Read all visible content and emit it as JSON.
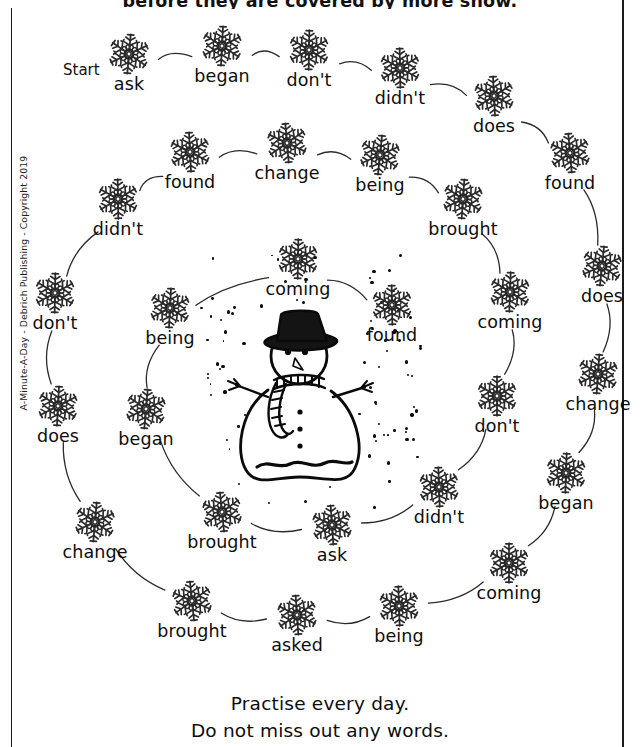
{
  "worksheet": {
    "top_instruction": "before they are covered by more snow.",
    "start_label": "Start",
    "copyright": "A-Minute-A-Day - Debrich Publishing - Copyright 2019",
    "footer_line1": "Practise every day.",
    "footer_line2": "Do not miss out any words.",
    "ink_color": "#0d0d0d",
    "paper_color": "#ffffff"
  },
  "center_illustration": {
    "name": "snowman",
    "features": [
      "top-hat",
      "carrot-nose",
      "coal-eyes",
      "striped-scarf",
      "twig-arms",
      "coal-buttons",
      "snow-ground"
    ]
  },
  "nodes": [
    {
      "id": 0,
      "word": "ask",
      "x": 129,
      "y": 54,
      "ring": "outer"
    },
    {
      "id": 1,
      "word": "began",
      "x": 222,
      "y": 46,
      "ring": "outer"
    },
    {
      "id": 2,
      "word": "don't",
      "x": 309,
      "y": 50,
      "ring": "outer"
    },
    {
      "id": 3,
      "word": "didn't",
      "x": 400,
      "y": 68,
      "ring": "outer"
    },
    {
      "id": 4,
      "word": "does",
      "x": 494,
      "y": 96,
      "ring": "outer"
    },
    {
      "id": 5,
      "word": "found",
      "x": 570,
      "y": 153,
      "ring": "outer"
    },
    {
      "id": 6,
      "word": "does",
      "x": 602,
      "y": 266,
      "ring": "outer"
    },
    {
      "id": 7,
      "word": "change",
      "x": 598,
      "y": 374,
      "ring": "outer"
    },
    {
      "id": 8,
      "word": "began",
      "x": 566,
      "y": 473,
      "ring": "outer"
    },
    {
      "id": 9,
      "word": "coming",
      "x": 509,
      "y": 563,
      "ring": "outer"
    },
    {
      "id": 10,
      "word": "being",
      "x": 399,
      "y": 606,
      "ring": "outer"
    },
    {
      "id": 11,
      "word": "asked",
      "x": 297,
      "y": 615,
      "ring": "outer"
    },
    {
      "id": 12,
      "word": "brought",
      "x": 192,
      "y": 601,
      "ring": "outer"
    },
    {
      "id": 13,
      "word": "change",
      "x": 95,
      "y": 522,
      "ring": "outer"
    },
    {
      "id": 14,
      "word": "does",
      "x": 58,
      "y": 406,
      "ring": "outer"
    },
    {
      "id": 15,
      "word": "don't",
      "x": 55,
      "y": 293,
      "ring": "outer"
    },
    {
      "id": 16,
      "word": "didn't",
      "x": 118,
      "y": 199,
      "ring": "outer"
    },
    {
      "id": 17,
      "word": "found",
      "x": 190,
      "y": 152,
      "ring": "middle"
    },
    {
      "id": 18,
      "word": "change",
      "x": 287,
      "y": 143,
      "ring": "middle"
    },
    {
      "id": 19,
      "word": "being",
      "x": 380,
      "y": 155,
      "ring": "middle"
    },
    {
      "id": 20,
      "word": "brought",
      "x": 463,
      "y": 199,
      "ring": "middle"
    },
    {
      "id": 21,
      "word": "coming",
      "x": 510,
      "y": 292,
      "ring": "middle"
    },
    {
      "id": 22,
      "word": "don't",
      "x": 497,
      "y": 396,
      "ring": "middle"
    },
    {
      "id": 23,
      "word": "didn't",
      "x": 439,
      "y": 487,
      "ring": "middle"
    },
    {
      "id": 24,
      "word": "ask",
      "x": 332,
      "y": 525,
      "ring": "middle"
    },
    {
      "id": 25,
      "word": "brought",
      "x": 222,
      "y": 512,
      "ring": "middle"
    },
    {
      "id": 26,
      "word": "began",
      "x": 146,
      "y": 409,
      "ring": "middle"
    },
    {
      "id": 27,
      "word": "being",
      "x": 170,
      "y": 308,
      "ring": "inner"
    },
    {
      "id": 28,
      "word": "coming",
      "x": 298,
      "y": 259,
      "ring": "inner"
    },
    {
      "id": 29,
      "word": "found",
      "x": 392,
      "y": 305,
      "ring": "inner"
    }
  ],
  "connectors": [
    {
      "from": 0,
      "to": 1
    },
    {
      "from": 1,
      "to": 2
    },
    {
      "from": 2,
      "to": 3
    },
    {
      "from": 3,
      "to": 4
    },
    {
      "from": 4,
      "to": 5
    },
    {
      "from": 5,
      "to": 6
    },
    {
      "from": 6,
      "to": 7
    },
    {
      "from": 7,
      "to": 8
    },
    {
      "from": 8,
      "to": 9
    },
    {
      "from": 9,
      "to": 10
    },
    {
      "from": 10,
      "to": 11
    },
    {
      "from": 11,
      "to": 12
    },
    {
      "from": 12,
      "to": 13
    },
    {
      "from": 13,
      "to": 14
    },
    {
      "from": 14,
      "to": 15
    },
    {
      "from": 15,
      "to": 16
    },
    {
      "from": 16,
      "to": 17
    },
    {
      "from": 17,
      "to": 18
    },
    {
      "from": 18,
      "to": 19
    },
    {
      "from": 19,
      "to": 20
    },
    {
      "from": 20,
      "to": 21
    },
    {
      "from": 21,
      "to": 22
    },
    {
      "from": 22,
      "to": 23
    },
    {
      "from": 23,
      "to": 24
    },
    {
      "from": 24,
      "to": 25
    },
    {
      "from": 25,
      "to": 26
    },
    {
      "from": 26,
      "to": 27
    },
    {
      "from": 27,
      "to": 28
    },
    {
      "from": 28,
      "to": 29
    }
  ],
  "word_list": [
    "ask",
    "began",
    "don't",
    "didn't",
    "does",
    "found",
    "does",
    "change",
    "began",
    "coming",
    "being",
    "asked",
    "brought",
    "change",
    "does",
    "don't",
    "didn't",
    "found",
    "change",
    "being",
    "brought",
    "coming",
    "don't",
    "didn't",
    "ask",
    "brought",
    "began",
    "being",
    "coming",
    "found"
  ]
}
